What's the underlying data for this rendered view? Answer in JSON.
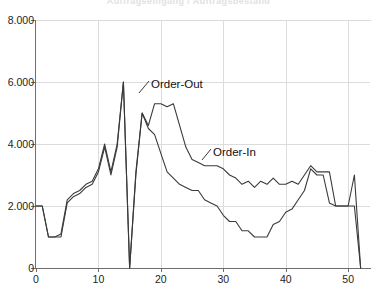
{
  "title_remnant": "Auftragseingang / Auftragsbestand",
  "chart_data": {
    "type": "line",
    "title": "",
    "xlabel": "",
    "ylabel": "",
    "xlim": [
      0,
      53.5
    ],
    "ylim": [
      0,
      8000
    ],
    "grid": true,
    "legend_position": "inline-annotation",
    "y_ticks": [
      0,
      2000,
      4000,
      6000,
      8000
    ],
    "y_tick_labels": [
      "0",
      "2.000",
      "4.000",
      "6.000",
      "8.000"
    ],
    "x_ticks": [
      0,
      10,
      20,
      30,
      40,
      50
    ],
    "x_tick_labels": [
      "0",
      "10",
      "20",
      "30",
      "40",
      "50"
    ],
    "line_color": "#3a3a3a",
    "grid_color": "#dcdcdc",
    "axis_color": "#6e6e6e",
    "annotations": [
      {
        "label": "Order-Out",
        "x_px": 151,
        "y_px": 78,
        "leader_to_x_px": 139,
        "leader_to_y_px": 93
      },
      {
        "label": "Order-In",
        "x_px": 213,
        "y_px": 146,
        "leader_to_x_px": 202,
        "leader_to_y_px": 160
      }
    ],
    "series": [
      {
        "name": "Order-Out",
        "x": [
          0,
          1,
          2,
          3,
          4,
          5,
          6,
          7,
          8,
          9,
          10,
          11,
          12,
          13,
          14,
          15,
          16,
          17,
          18,
          19,
          20,
          21,
          22,
          23,
          24,
          25,
          26,
          27,
          28,
          29,
          30,
          31,
          32,
          33,
          34,
          35,
          36,
          37,
          38,
          39,
          40,
          41,
          42,
          43,
          44,
          45,
          46,
          47,
          48,
          49,
          50,
          51,
          52
        ],
        "values": [
          2000,
          2000,
          1000,
          1000,
          1000,
          2100,
          2300,
          2400,
          2600,
          2700,
          3100,
          3900,
          3000,
          3900,
          6000,
          0,
          3000,
          5000,
          4500,
          4300,
          3700,
          3100,
          2900,
          2700,
          2600,
          2500,
          2500,
          2200,
          2100,
          2000,
          1700,
          1500,
          1500,
          1200,
          1200,
          1000,
          1000,
          1000,
          1400,
          1500,
          1800,
          1900,
          2200,
          2500,
          3200,
          3000,
          3000,
          2100,
          2000,
          2000,
          2000,
          2000,
          0
        ]
      },
      {
        "name": "Order-In",
        "x": [
          0,
          1,
          2,
          3,
          4,
          5,
          6,
          7,
          8,
          9,
          10,
          11,
          12,
          13,
          14,
          15,
          16,
          17,
          18,
          19,
          20,
          21,
          22,
          23,
          24,
          25,
          26,
          27,
          28,
          29,
          30,
          31,
          32,
          33,
          34,
          35,
          36,
          37,
          38,
          39,
          40,
          41,
          42,
          43,
          44,
          45,
          46,
          47,
          48,
          49,
          50,
          51,
          52
        ],
        "values": [
          2000,
          2000,
          1000,
          1000,
          1100,
          2200,
          2400,
          2500,
          2700,
          2800,
          3200,
          4000,
          3100,
          4000,
          6000,
          0,
          3100,
          5000,
          4600,
          5300,
          5300,
          5200,
          5300,
          4600,
          3900,
          3500,
          3400,
          3300,
          3300,
          3300,
          3200,
          3000,
          2900,
          2700,
          2800,
          2600,
          2800,
          2700,
          2900,
          2700,
          2700,
          2800,
          2700,
          3000,
          3300,
          3100,
          3100,
          3100,
          2000,
          2000,
          2000,
          3000,
          0
        ]
      }
    ]
  }
}
